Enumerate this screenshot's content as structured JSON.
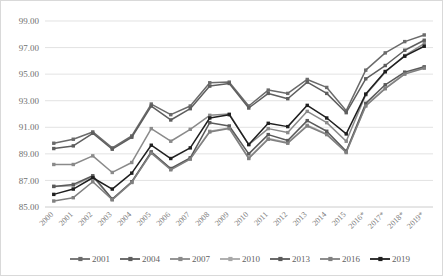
{
  "chart_data": {
    "type": "line",
    "title": "",
    "subtitle": "",
    "xlabel": "",
    "ylabel": "",
    "ylim": [
      85.0,
      99.0
    ],
    "ytick_step": 2.0,
    "ytick_labels": [
      "99.00",
      "97.00",
      "95.00",
      "93.00",
      "91.00",
      "89.00",
      "87.00",
      "85.00"
    ],
    "ytick_values": [
      99.0,
      97.0,
      95.0,
      93.0,
      91.0,
      89.0,
      87.0,
      85.0
    ],
    "grid": true,
    "grid_axis": "y",
    "legend_position": "bottom",
    "categories": [
      "2000",
      "2001",
      "2002",
      "2003",
      "2004",
      "2005",
      "2006",
      "2007",
      "2008",
      "2009",
      "2010",
      "2011",
      "2012",
      "2013",
      "2014",
      "2015",
      "2016*",
      "2017*",
      "2018*",
      "2019*"
    ],
    "series": [
      {
        "name": "2001",
        "color": "#6b6b6b",
        "marker": "square",
        "values": [
          89.8,
          90.1,
          90.65,
          89.45,
          90.35,
          92.75,
          91.95,
          92.6,
          94.35,
          94.4,
          92.6,
          93.8,
          93.55,
          94.6,
          94.0,
          92.25,
          95.3,
          96.6,
          97.45,
          97.95
        ]
      },
      {
        "name": "2004",
        "color": "#5e5e5e",
        "marker": "square",
        "values": [
          89.4,
          89.6,
          90.55,
          89.35,
          90.25,
          92.6,
          91.55,
          92.4,
          94.1,
          94.3,
          92.45,
          93.55,
          93.15,
          94.4,
          93.55,
          92.1,
          94.65,
          95.65,
          96.8,
          97.55
        ]
      },
      {
        "name": "2007",
        "color": "#8a8a8a",
        "marker": "square",
        "values": [
          88.2,
          88.2,
          88.85,
          87.6,
          88.35,
          90.9,
          89.95,
          90.85,
          91.9,
          92.0,
          89.7,
          90.9,
          90.6,
          92.2,
          91.35,
          89.95,
          93.45,
          95.15,
          96.4,
          97.3
        ]
      },
      {
        "name": "2010",
        "color": "#a8a8a8",
        "marker": "square",
        "values": [
          86.55,
          86.6,
          87.3,
          85.55,
          86.85,
          89.1,
          87.85,
          88.65,
          90.7,
          90.95,
          88.7,
          90.15,
          89.85,
          91.15,
          90.5,
          89.15,
          92.65,
          93.95,
          95.05,
          95.5
        ]
      },
      {
        "name": "2013",
        "color": "#5a5a5a",
        "marker": "square",
        "values": [
          86.55,
          86.7,
          87.35,
          85.6,
          86.9,
          89.15,
          87.9,
          88.7,
          91.35,
          91.1,
          89.0,
          90.45,
          90.0,
          91.5,
          90.7,
          89.2,
          92.8,
          94.2,
          95.15,
          95.55
        ]
      },
      {
        "name": "2016",
        "color": "#808080",
        "marker": "square",
        "values": [
          85.45,
          85.7,
          86.9,
          85.55,
          86.85,
          89.05,
          87.8,
          88.6,
          90.65,
          90.9,
          88.65,
          90.1,
          89.8,
          91.1,
          90.45,
          89.1,
          92.6,
          93.9,
          95.0,
          95.45
        ]
      },
      {
        "name": "2019",
        "color": "#1f1f1f",
        "marker": "square",
        "values": [
          85.95,
          86.35,
          87.2,
          86.35,
          87.55,
          89.65,
          88.65,
          89.45,
          91.7,
          91.95,
          89.7,
          91.3,
          91.05,
          92.65,
          91.7,
          90.5,
          93.5,
          95.2,
          96.35,
          97.1
        ]
      }
    ]
  },
  "axes": {
    "y_axis_name": "value-axis",
    "x_axis_name": "category-axis"
  },
  "legend": {
    "items": [
      {
        "label": "2001",
        "color": "#6b6b6b"
      },
      {
        "label": "2004",
        "color": "#5e5e5e"
      },
      {
        "label": "2007",
        "color": "#8a8a8a"
      },
      {
        "label": "2010",
        "color": "#a8a8a8"
      },
      {
        "label": "2013",
        "color": "#5a5a5a"
      },
      {
        "label": "2016",
        "color": "#808080"
      },
      {
        "label": "2019",
        "color": "#1f1f1f"
      }
    ]
  },
  "colors": {
    "background": "#ffffff",
    "border": "#d9d9d9",
    "gridline": "#d6d6d6",
    "tick_text": "#6f6f6f",
    "legend_text": "#5f5f5f"
  }
}
